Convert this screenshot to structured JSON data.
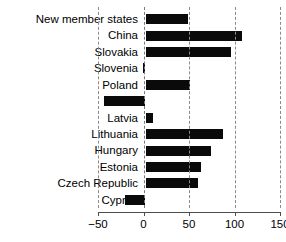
{
  "chart_data": {
    "type": "bar",
    "orientation": "horizontal",
    "title": "",
    "xlabel": "",
    "ylabel": "",
    "xlim": [
      -50,
      150
    ],
    "xticks": [
      -50,
      0,
      50,
      100,
      150
    ],
    "xtick_labels": [
      "−50",
      "0",
      "50",
      "100",
      "150"
    ],
    "grid": true,
    "grid_axis": "x",
    "legend": false,
    "bar_color": "#0a0a0a",
    "categories": [
      "New member states",
      "China",
      "Slovakia",
      "Slovenia",
      "Poland",
      "Malta",
      "Latvia",
      "Lithuania",
      "Hungary",
      "Estonia",
      "Czech Republic",
      "Cyprus"
    ],
    "values": [
      47,
      106,
      94,
      -3,
      49,
      -46,
      8,
      85,
      72,
      61,
      58,
      -23
    ]
  },
  "axis": {
    "zero_label": "0"
  }
}
